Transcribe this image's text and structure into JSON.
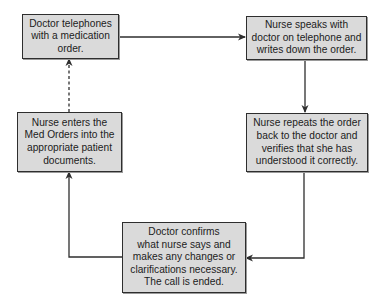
{
  "diagram": {
    "type": "flowchart",
    "nodes": [
      {
        "id": "doctor-calls",
        "lines": [
          "Doctor telephones",
          "with a medication",
          "order."
        ]
      },
      {
        "id": "nurse-writes",
        "lines": [
          "Nurse speaks with",
          "doctor on telephone and",
          "writes down the order."
        ]
      },
      {
        "id": "nurse-repeats",
        "lines": [
          "Nurse repeats the order",
          "back to the doctor and",
          "verifies that she has",
          "understood it correctly."
        ]
      },
      {
        "id": "doctor-confirms",
        "lines": [
          "Doctor confirms",
          "what nurse says and",
          "makes any changes or",
          "clarifications necessary.",
          "The call is ended."
        ]
      },
      {
        "id": "nurse-enters",
        "lines": [
          "Nurse enters the",
          "Med Orders into the",
          "appropriate patient",
          "documents."
        ]
      }
    ],
    "edges": [
      {
        "from": "doctor-calls",
        "to": "nurse-writes",
        "style": "solid"
      },
      {
        "from": "nurse-writes",
        "to": "nurse-repeats",
        "style": "solid"
      },
      {
        "from": "nurse-repeats",
        "to": "doctor-confirms",
        "style": "solid"
      },
      {
        "from": "doctor-confirms",
        "to": "nurse-enters",
        "style": "solid"
      },
      {
        "from": "nurse-enters",
        "to": "doctor-calls",
        "style": "dashed"
      }
    ],
    "colors": {
      "box_fill": "#dadada",
      "box_border": "#2e2e2e",
      "line": "#2e2e2e",
      "text": "#1c1c1c"
    }
  }
}
